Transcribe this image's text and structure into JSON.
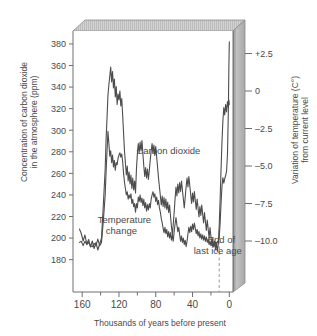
{
  "chart_data": {
    "type": "line",
    "title": "",
    "xlabel": "Thousands of years before present",
    "ylabel": "Concentration of carbon dioxide in the atmosphere (ppm)",
    "ylabel_line1": "Concentration of carbon dioxide",
    "ylabel_line2": "in the atmosphere (ppm)",
    "y2label": "Variation of temperature (C°) from current level",
    "y2label_line1": "Variation of temperature (C°)",
    "y2label_line2": "from current level",
    "xlim": [
      170,
      -4
    ],
    "x_reversed": true,
    "xticks": [
      160,
      120,
      80,
      40,
      0
    ],
    "xtick_labels": [
      "160",
      "120",
      "80",
      "40",
      "0"
    ],
    "x_minor_ticks": [
      140,
      100,
      60,
      20
    ],
    "ylim": [
      150,
      392
    ],
    "yticks": [
      180,
      200,
      220,
      240,
      260,
      280,
      300,
      320,
      340,
      360,
      380
    ],
    "ytick_labels": [
      "180",
      "200",
      "220",
      "240",
      "260",
      "280",
      "300",
      "320",
      "340",
      "360",
      "380"
    ],
    "y2lim": [
      -12.8,
      4.6
    ],
    "y2ticks": [
      2.5,
      0,
      -2.5,
      -5.0,
      -7.5,
      -10.0
    ],
    "y2tick_labels": [
      "+2.5",
      "0",
      "–2.5",
      "–5.0",
      "–7.5",
      "–10.0"
    ],
    "grid": false,
    "legend_position": "inline-annotations",
    "line_color": "#4d4d4d",
    "axis_color": "#6e6e6e",
    "panel_fill": "#ffffff",
    "slab_top_fill": "#cfcfcf",
    "slab_side_fill": "#b8b8b8",
    "annotations": [
      {
        "name": "carbon-dioxide-label",
        "text": "Carbon dioxide",
        "x": 101,
        "y": 278
      },
      {
        "name": "temperature-change-label",
        "text_line1": "Temperature",
        "text_line2": "change",
        "x": 143,
        "y": -8.2
      },
      {
        "name": "end-of-last-ice-age-label",
        "text_line1": "End of",
        "text_line2": "last ice age",
        "x": 30,
        "y": -9.5
      },
      {
        "name": "ice-age-marker",
        "type": "dashed-vline",
        "x": 11
      }
    ],
    "series": [
      {
        "name": "Carbon dioxide",
        "unit": "ppm",
        "axis": "left",
        "color": "#4d4d4d",
        "points": [
          [
            163,
            196
          ],
          [
            161,
            197
          ],
          [
            159,
            193
          ],
          [
            157,
            197
          ],
          [
            155,
            194
          ],
          [
            153,
            196
          ],
          [
            151,
            193
          ],
          [
            149,
            192
          ],
          [
            147,
            195
          ],
          [
            145,
            193
          ],
          [
            143,
            199
          ],
          [
            141,
            193
          ],
          [
            139,
            196
          ],
          [
            137,
            216
          ],
          [
            135,
            240
          ],
          [
            134,
            262
          ],
          [
            133,
            280
          ],
          [
            132,
            299
          ],
          [
            131,
            288
          ],
          [
            130,
            276
          ],
          [
            129,
            281
          ],
          [
            128,
            270
          ],
          [
            127,
            277
          ],
          [
            126,
            266
          ],
          [
            125,
            272
          ],
          [
            124,
            263
          ],
          [
            123,
            270
          ],
          [
            122,
            268
          ],
          [
            121,
            274
          ],
          [
            120,
            277
          ],
          [
            119,
            279
          ],
          [
            118,
            275
          ],
          [
            117,
            278
          ],
          [
            116,
            271
          ],
          [
            115,
            260
          ],
          [
            114,
            252
          ],
          [
            113,
            246
          ],
          [
            112,
            240
          ],
          [
            111,
            243
          ],
          [
            110,
            236
          ],
          [
            109,
            240
          ],
          [
            108,
            237
          ],
          [
            107,
            241
          ],
          [
            106,
            232
          ],
          [
            105,
            236
          ],
          [
            104,
            229
          ],
          [
            103,
            232
          ],
          [
            102,
            224
          ],
          [
            101,
            232
          ],
          [
            100,
            228
          ],
          [
            99,
            238
          ],
          [
            98,
            234
          ],
          [
            97,
            240
          ],
          [
            96,
            233
          ],
          [
            95,
            237
          ],
          [
            94,
            230
          ],
          [
            93,
            236
          ],
          [
            92,
            228
          ],
          [
            91,
            233
          ],
          [
            90,
            225
          ],
          [
            89,
            231
          ],
          [
            88,
            226
          ],
          [
            87,
            232
          ],
          [
            86,
            228
          ],
          [
            85,
            236
          ],
          [
            84,
            240
          ],
          [
            83,
            243
          ],
          [
            82,
            238
          ],
          [
            81,
            241
          ],
          [
            80,
            234
          ],
          [
            79,
            238
          ],
          [
            78,
            231
          ],
          [
            77,
            235
          ],
          [
            76,
            228
          ],
          [
            75,
            224
          ],
          [
            74,
            218
          ],
          [
            73,
            214
          ],
          [
            72,
            209
          ],
          [
            71,
            205
          ],
          [
            70,
            210
          ],
          [
            69,
            204
          ],
          [
            68,
            208
          ],
          [
            67,
            201
          ],
          [
            66,
            206
          ],
          [
            65,
            200
          ],
          [
            64,
            205
          ],
          [
            63,
            198
          ],
          [
            62,
            203
          ],
          [
            61,
            197
          ],
          [
            60,
            206
          ],
          [
            59,
            213
          ],
          [
            58,
            219
          ],
          [
            57,
            212
          ],
          [
            56,
            206
          ],
          [
            55,
            210
          ],
          [
            54,
            203
          ],
          [
            53,
            197
          ],
          [
            52,
            202
          ],
          [
            51,
            196
          ],
          [
            50,
            200
          ],
          [
            49,
            194
          ],
          [
            48,
            198
          ],
          [
            47,
            192
          ],
          [
            46,
            197
          ],
          [
            45,
            204
          ],
          [
            44,
            210
          ],
          [
            43,
            205
          ],
          [
            42,
            211
          ],
          [
            41,
            206
          ],
          [
            40,
            213
          ],
          [
            39,
            208
          ],
          [
            38,
            214
          ],
          [
            37,
            209
          ],
          [
            36,
            204
          ],
          [
            35,
            208
          ],
          [
            34,
            202
          ],
          [
            33,
            206
          ],
          [
            32,
            200
          ],
          [
            31,
            204
          ],
          [
            30,
            199
          ],
          [
            29,
            203
          ],
          [
            28,
            198
          ],
          [
            27,
            202
          ],
          [
            26,
            197
          ],
          [
            25,
            201
          ],
          [
            24,
            196
          ],
          [
            23,
            199
          ],
          [
            22,
            194
          ],
          [
            21,
            197
          ],
          [
            20,
            193
          ],
          [
            19,
            196
          ],
          [
            18,
            192
          ],
          [
            17,
            195
          ],
          [
            16,
            193
          ],
          [
            15,
            196
          ],
          [
            14,
            194
          ],
          [
            13,
            197
          ],
          [
            12,
            196
          ],
          [
            11,
            200
          ],
          [
            10,
            214
          ],
          [
            9,
            232
          ],
          [
            8,
            248
          ],
          [
            7,
            256
          ],
          [
            6,
            251
          ],
          [
            5,
            255
          ],
          [
            4,
            258
          ],
          [
            3,
            262
          ],
          [
            2,
            278
          ],
          [
            1,
            320
          ],
          [
            0.5,
            358
          ],
          [
            0,
            382
          ]
        ]
      },
      {
        "name": "Temperature change",
        "unit": "C°",
        "axis": "right",
        "color": "#4d4d4d",
        "points": [
          [
            163,
            -8.6
          ],
          [
            161,
            -8.9
          ],
          [
            159,
            -9.4
          ],
          [
            157,
            -9.0
          ],
          [
            155,
            -9.6
          ],
          [
            153,
            -9.3
          ],
          [
            151,
            -9.8
          ],
          [
            149,
            -9.4
          ],
          [
            147,
            -9.9
          ],
          [
            145,
            -9.5
          ],
          [
            143,
            -10.0
          ],
          [
            141,
            -9.6
          ],
          [
            139,
            -9.2
          ],
          [
            137,
            -7.0
          ],
          [
            135,
            -4.6
          ],
          [
            134,
            -2.6
          ],
          [
            133,
            -1.2
          ],
          [
            132,
            0.3
          ],
          [
            131,
            1.0
          ],
          [
            130,
            1.6
          ],
          [
            129,
            2.2
          ],
          [
            128,
            1.2
          ],
          [
            127,
            1.9
          ],
          [
            126,
            0.8
          ],
          [
            125,
            1.4
          ],
          [
            124,
            0.2
          ],
          [
            123,
            0.9
          ],
          [
            122,
            -0.3
          ],
          [
            121,
            0.4
          ],
          [
            120,
            0.0
          ],
          [
            119,
            0.6
          ],
          [
            118,
            -0.4
          ],
          [
            117,
            0.1
          ],
          [
            116,
            -1.0
          ],
          [
            115,
            -2.2
          ],
          [
            114,
            -3.4
          ],
          [
            113,
            -4.2
          ],
          [
            112,
            -5.0
          ],
          [
            111,
            -4.4
          ],
          [
            110,
            -5.4
          ],
          [
            109,
            -4.8
          ],
          [
            108,
            -5.6
          ],
          [
            107,
            -5.0
          ],
          [
            106,
            -5.9
          ],
          [
            105,
            -5.2
          ],
          [
            104,
            -6.0
          ],
          [
            103,
            -5.4
          ],
          [
            102,
            -6.2
          ],
          [
            101,
            -4.6
          ],
          [
            100,
            -3.6
          ],
          [
            99,
            -2.9
          ],
          [
            98,
            -3.5
          ],
          [
            97,
            -2.8
          ],
          [
            96,
            -3.4
          ],
          [
            95,
            -2.7
          ],
          [
            94,
            -3.6
          ],
          [
            93,
            -4.4
          ],
          [
            92,
            -5.1
          ],
          [
            91,
            -4.5
          ],
          [
            90,
            -5.2
          ],
          [
            89,
            -4.6
          ],
          [
            88,
            -5.3
          ],
          [
            87,
            -4.7
          ],
          [
            86,
            -4.0
          ],
          [
            85,
            -3.4
          ],
          [
            84,
            -2.9
          ],
          [
            83,
            -3.5
          ],
          [
            82,
            -3.0
          ],
          [
            81,
            -3.7
          ],
          [
            80,
            -3.1
          ],
          [
            79,
            -3.8
          ],
          [
            78,
            -4.5
          ],
          [
            77,
            -5.2
          ],
          [
            76,
            -5.8
          ],
          [
            75,
            -6.4
          ],
          [
            74,
            -7.0
          ],
          [
            73,
            -6.4
          ],
          [
            72,
            -7.1
          ],
          [
            71,
            -6.5
          ],
          [
            70,
            -7.2
          ],
          [
            69,
            -6.6
          ],
          [
            68,
            -7.3
          ],
          [
            67,
            -6.8
          ],
          [
            66,
            -7.5
          ],
          [
            65,
            -7.0
          ],
          [
            64,
            -7.7
          ],
          [
            63,
            -8.4
          ],
          [
            62,
            -9.0
          ],
          [
            61,
            -8.3
          ],
          [
            60,
            -7.5
          ],
          [
            59,
            -6.6
          ],
          [
            58,
            -5.8
          ],
          [
            57,
            -6.4
          ],
          [
            56,
            -5.6
          ],
          [
            55,
            -6.2
          ],
          [
            54,
            -5.5
          ],
          [
            53,
            -6.1
          ],
          [
            52,
            -5.4
          ],
          [
            51,
            -6.0
          ],
          [
            50,
            -6.6
          ],
          [
            49,
            -7.2
          ],
          [
            48,
            -6.5
          ],
          [
            47,
            -5.8
          ],
          [
            46,
            -5.2
          ],
          [
            45,
            -5.8
          ],
          [
            44,
            -5.1
          ],
          [
            43,
            -5.7
          ],
          [
            42,
            -6.3
          ],
          [
            41,
            -6.9
          ],
          [
            40,
            -6.2
          ],
          [
            39,
            -6.8
          ],
          [
            38,
            -6.1
          ],
          [
            37,
            -6.7
          ],
          [
            36,
            -7.3
          ],
          [
            35,
            -6.6
          ],
          [
            34,
            -7.2
          ],
          [
            33,
            -7.8
          ],
          [
            32,
            -7.1
          ],
          [
            31,
            -7.7
          ],
          [
            30,
            -7.0
          ],
          [
            29,
            -7.6
          ],
          [
            28,
            -8.2
          ],
          [
            27,
            -7.5
          ],
          [
            26,
            -8.1
          ],
          [
            25,
            -8.7
          ],
          [
            24,
            -8.0
          ],
          [
            23,
            -8.6
          ],
          [
            22,
            -9.2
          ],
          [
            21,
            -8.5
          ],
          [
            20,
            -9.1
          ],
          [
            19,
            -9.7
          ],
          [
            18,
            -9.2
          ],
          [
            17,
            -9.8
          ],
          [
            16,
            -9.4
          ],
          [
            15,
            -10.0
          ],
          [
            14,
            -9.5
          ],
          [
            13,
            -10.1
          ],
          [
            12,
            -9.6
          ],
          [
            11,
            -8.4
          ],
          [
            10,
            -6.6
          ],
          [
            9,
            -4.6
          ],
          [
            8,
            -2.8
          ],
          [
            7,
            -1.4
          ],
          [
            6,
            -0.5
          ],
          [
            5,
            -1.0
          ],
          [
            4,
            -0.3
          ],
          [
            3,
            -0.8
          ],
          [
            2,
            -0.1
          ],
          [
            1,
            -0.5
          ],
          [
            0.5,
            0.0
          ],
          [
            0,
            -0.3
          ]
        ]
      }
    ]
  }
}
